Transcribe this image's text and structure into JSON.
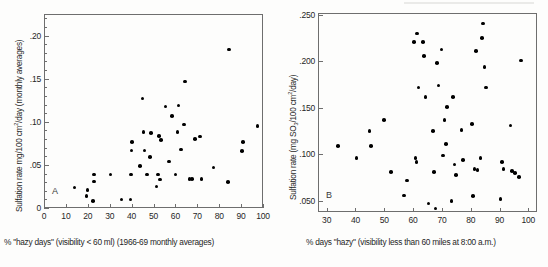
{
  "figure": {
    "background_color": "#fdfdfc",
    "axis_color": "#6e6e6e",
    "point_color": "#000000"
  },
  "chart_data": [
    {
      "type": "scatter",
      "panel_label": "A",
      "title": "",
      "xlabel": "% \"hazy days\" (visibility < 60 ml) (1966-69 monthly averages)",
      "ylabel": "Sulfation rate mg/100 cm2/day (monthly averages)",
      "ylabel_parts": {
        "pre": "Sulfation rate mg/100 cm",
        "sup": "2",
        "post": "/day (monthly averages)"
      },
      "xlim": [
        0,
        100
      ],
      "ylim": [
        0,
        0.225
      ],
      "xticks": [
        0,
        10,
        20,
        30,
        40,
        50,
        60,
        70,
        80,
        90,
        100
      ],
      "xticklabels": [
        "0",
        "10",
        "20",
        "30",
        "40",
        "50",
        "60",
        "70",
        "80",
        "90",
        "100"
      ],
      "yticks": [
        0,
        0.05,
        0.1,
        0.15,
        0.2
      ],
      "yticklabels": [
        "0",
        ".05",
        ".10",
        ".15",
        ".20"
      ],
      "minor_yticks": [
        0.01,
        0.02,
        0.03,
        0.04,
        0.06,
        0.07,
        0.08,
        0.09,
        0.11,
        0.12,
        0.13,
        0.14,
        0.16,
        0.17,
        0.18,
        0.19,
        0.21,
        0.22
      ],
      "grid": false,
      "legend": "none",
      "points": [
        [
          13.5,
          0.025
        ],
        [
          19.0,
          0.015
        ],
        [
          19.5,
          0.022
        ],
        [
          22.0,
          0.009
        ],
        [
          22.3,
          0.04
        ],
        [
          22.5,
          0.032
        ],
        [
          30.0,
          0.04
        ],
        [
          35.0,
          0.011
        ],
        [
          39.0,
          0.011
        ],
        [
          39.2,
          0.04
        ],
        [
          39.5,
          0.068
        ],
        [
          39.8,
          0.078
        ],
        [
          43.5,
          0.05
        ],
        [
          44.5,
          0.128
        ],
        [
          45.0,
          0.089
        ],
        [
          45.5,
          0.068
        ],
        [
          46.5,
          0.04
        ],
        [
          48.0,
          0.06
        ],
        [
          48.5,
          0.088
        ],
        [
          51.0,
          0.026
        ],
        [
          51.5,
          0.04
        ],
        [
          52.0,
          0.085
        ],
        [
          52.5,
          0.034
        ],
        [
          53.0,
          0.08
        ],
        [
          55.0,
          0.119
        ],
        [
          56.5,
          0.055
        ],
        [
          58.0,
          0.108
        ],
        [
          59.5,
          0.04
        ],
        [
          60.5,
          0.089
        ],
        [
          61.0,
          0.12
        ],
        [
          62.0,
          0.069
        ],
        [
          63.5,
          0.098
        ],
        [
          64.0,
          0.148
        ],
        [
          66.0,
          0.035
        ],
        [
          67.0,
          0.035
        ],
        [
          68.5,
          0.081
        ],
        [
          70.5,
          0.084
        ],
        [
          71.0,
          0.084
        ],
        [
          71.5,
          0.035
        ],
        [
          77.0,
          0.048
        ],
        [
          83.5,
          0.031
        ],
        [
          84.0,
          0.185
        ],
        [
          90.0,
          0.067
        ],
        [
          90.5,
          0.078
        ],
        [
          97.0,
          0.096
        ]
      ]
    },
    {
      "type": "scatter",
      "panel_label": "B",
      "title": "",
      "xlabel": "% days \"hazy\" (visibility less than 60 miles at 8:00 a.m.)",
      "ylabel": "Sulfation rate (mg SO3/100 cm2/day)",
      "ylabel_parts": {
        "pre": "Sulfation rate (mg SO",
        "sub": "3",
        "mid": "/100 cm",
        "sup": "2",
        "post": "/day)"
      },
      "xlim": [
        27,
        103
      ],
      "ylim": [
        0.038,
        0.252
      ],
      "xticks": [
        30,
        40,
        50,
        60,
        70,
        80,
        90,
        100
      ],
      "xticklabels": [
        "30",
        "40",
        "50",
        "60",
        "70",
        "80",
        "90",
        "100"
      ],
      "yticks": [
        0.05,
        0.1,
        0.15,
        0.2,
        0.25
      ],
      "yticklabels": [
        ".050",
        ".100",
        ".150",
        ".200",
        ".250"
      ],
      "grid": false,
      "legend": "none",
      "points": [
        [
          33.5,
          0.11
        ],
        [
          40.0,
          0.097
        ],
        [
          44.5,
          0.126
        ],
        [
          45.0,
          0.11
        ],
        [
          49.5,
          0.138
        ],
        [
          52.0,
          0.082
        ],
        [
          56.5,
          0.057
        ],
        [
          57.5,
          0.073
        ],
        [
          60.0,
          0.222
        ],
        [
          60.5,
          0.097
        ],
        [
          60.8,
          0.093
        ],
        [
          61.0,
          0.231
        ],
        [
          61.5,
          0.173
        ],
        [
          63.0,
          0.222
        ],
        [
          63.5,
          0.207
        ],
        [
          64.0,
          0.163
        ],
        [
          65.0,
          0.048
        ],
        [
          66.5,
          0.126
        ],
        [
          67.0,
          0.082
        ],
        [
          67.5,
          0.043
        ],
        [
          68.0,
          0.199
        ],
        [
          68.5,
          0.175
        ],
        [
          69.5,
          0.214
        ],
        [
          70.0,
          0.1
        ],
        [
          70.5,
          0.138
        ],
        [
          71.0,
          0.112
        ],
        [
          71.5,
          0.152
        ],
        [
          73.0,
          0.051
        ],
        [
          73.5,
          0.163
        ],
        [
          74.0,
          0.09
        ],
        [
          74.5,
          0.079
        ],
        [
          76.5,
          0.127
        ],
        [
          77.0,
          0.095
        ],
        [
          80.0,
          0.134
        ],
        [
          80.5,
          0.056
        ],
        [
          81.0,
          0.085
        ],
        [
          81.5,
          0.212
        ],
        [
          82.0,
          0.084
        ],
        [
          83.0,
          0.097
        ],
        [
          83.5,
          0.226
        ],
        [
          84.0,
          0.242
        ],
        [
          84.5,
          0.195
        ],
        [
          85.0,
          0.173
        ],
        [
          90.0,
          0.053
        ],
        [
          90.5,
          0.093
        ],
        [
          91.0,
          0.085
        ],
        [
          93.5,
          0.132
        ],
        [
          94.0,
          0.083
        ],
        [
          95.0,
          0.081
        ],
        [
          96.5,
          0.077
        ],
        [
          97.0,
          0.202
        ]
      ]
    }
  ]
}
